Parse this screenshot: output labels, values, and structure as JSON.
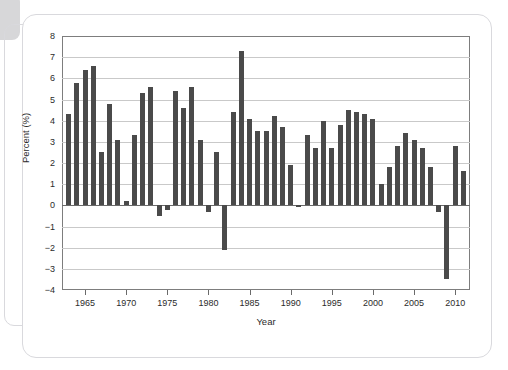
{
  "chart_data": {
    "type": "bar",
    "title": "",
    "xlabel": "Year",
    "ylabel": "Percent (%)",
    "xlim": [
      1962.2,
      2011.8
    ],
    "ylim": [
      -4,
      8
    ],
    "ytick_values": [
      8,
      7,
      6,
      5,
      4,
      3,
      2,
      1,
      0,
      -1,
      -2,
      -3,
      -4
    ],
    "ytick_labels": [
      "8",
      "7",
      "6",
      "5",
      "4",
      "3",
      "2",
      "1",
      "0",
      "−1",
      "−2",
      "−3",
      "−4"
    ],
    "xtick_values": [
      1965,
      1970,
      1975,
      1980,
      1985,
      1990,
      1995,
      2000,
      2005,
      2010
    ],
    "xtick_labels": [
      "1965",
      "1970",
      "1975",
      "1980",
      "1985",
      "1990",
      "1995",
      "2000",
      "2005",
      "2010"
    ],
    "grid": true,
    "legend": "none",
    "bar_color": "#4a4a4a",
    "categories": [
      1963,
      1964,
      1965,
      1966,
      1967,
      1968,
      1969,
      1970,
      1971,
      1972,
      1973,
      1974,
      1975,
      1976,
      1977,
      1978,
      1979,
      1980,
      1981,
      1982,
      1983,
      1984,
      1985,
      1986,
      1987,
      1988,
      1989,
      1990,
      1991,
      1992,
      1993,
      1994,
      1995,
      1996,
      1997,
      1998,
      1999,
      2000,
      2001,
      2002,
      2003,
      2004,
      2005,
      2006,
      2007,
      2008,
      2009,
      2010,
      2011
    ],
    "values": [
      4.3,
      5.8,
      6.4,
      6.6,
      2.5,
      4.8,
      3.1,
      0.2,
      3.3,
      5.3,
      5.6,
      -0.5,
      -0.2,
      5.4,
      4.6,
      5.6,
      3.1,
      -0.3,
      2.5,
      -2.1,
      4.4,
      7.3,
      4.1,
      3.5,
      3.5,
      4.2,
      3.7,
      1.9,
      -0.1,
      3.3,
      2.7,
      4.0,
      2.7,
      3.8,
      4.5,
      4.4,
      4.3,
      4.1,
      1.0,
      1.8,
      2.8,
      3.4,
      3.1,
      2.7,
      1.8,
      -0.3,
      -3.5,
      2.8,
      1.6
    ]
  },
  "figure": {
    "axis_y_title": "Percent (%)",
    "axis_x_title": "Year"
  }
}
